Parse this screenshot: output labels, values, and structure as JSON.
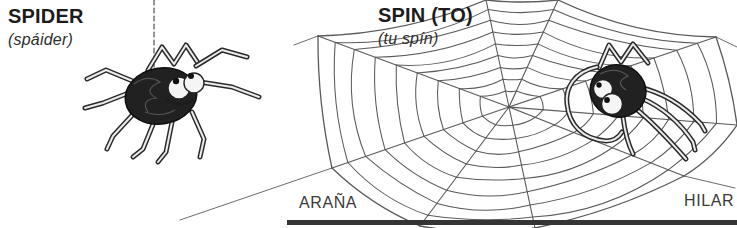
{
  "entries": {
    "spider": {
      "term": "SPIDER",
      "pronunciation": "(spáider)",
      "translation": "ARAÑA"
    },
    "spin": {
      "term": "SPIN (TO)",
      "pronunciation": "(tu spín)",
      "translation": "HILAR"
    }
  },
  "illustrations": {
    "left": "cartoon-spider-hanging-from-silk-thread",
    "right": "cartoon-spider-sitting-on-spiderweb"
  },
  "colors": {
    "background": "#ffffff",
    "ink": "#1c1c1c",
    "pencil": "#5a5a5a",
    "rule": "#343434"
  }
}
